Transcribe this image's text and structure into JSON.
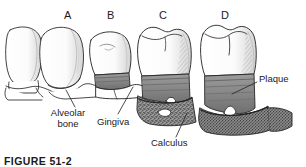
{
  "figure": {
    "domain": "anatomical-illustration",
    "caption_partial": "FIGURE 51-2",
    "background_color": "#ffffff",
    "ink_color": "#1a1a1a"
  },
  "panels": [
    {
      "id": "A",
      "letter": "A",
      "x": 64,
      "y": 10,
      "description": "healthy teeth, normal alveolar bone, no plaque"
    },
    {
      "id": "B",
      "letter": "B",
      "x": 107,
      "y": 10,
      "description": "gingivitis, inflamed gingiva band"
    },
    {
      "id": "C",
      "letter": "C",
      "x": 159,
      "y": 10,
      "description": "early periodontitis with calculus and bone loss"
    },
    {
      "id": "D",
      "letter": "D",
      "x": 221,
      "y": 10,
      "description": "advanced periodontitis, furcation exposed"
    }
  ],
  "callouts": [
    {
      "name": "alveolar-bone",
      "label_line1": "Alveolar",
      "label_line2": "bone",
      "label_x": 39,
      "label_y": 110,
      "label_width": 58,
      "leader": {
        "x1": 75,
        "y1": 108,
        "x2": 66,
        "y2": 90
      }
    },
    {
      "name": "gingiva",
      "label_line1": "Gingiva",
      "label_line2": "",
      "label_x": 97,
      "label_y": 117,
      "label_width": 46,
      "leader": {
        "x1": 118,
        "y1": 115,
        "x2": 133,
        "y2": 88
      }
    },
    {
      "name": "calculus",
      "label_line1": "Calculus",
      "label_line2": "",
      "label_x": 151,
      "label_y": 140,
      "label_width": 50,
      "leader": {
        "x1": 176,
        "y1": 138,
        "x2": 186,
        "y2": 114
      }
    },
    {
      "name": "plaque",
      "label_line1": "Plaque",
      "label_line2": "",
      "label_x": 259,
      "label_y": 76,
      "label_width": 42,
      "leader": {
        "x1": 258,
        "y1": 81,
        "x2": 232,
        "y2": 93
      }
    }
  ],
  "palette": {
    "enamel_fill": "#ffffff",
    "enamel_shade": "#d8d8d8",
    "enamel_shade_light": "#ececec",
    "outline": "#2b2b2b",
    "gingiva_fill": "#8f8f8f",
    "gingiva_dark": "#6e6e6e",
    "calculus_fill": "#8a8a8a",
    "calculus_speckle": "#3a3a3a",
    "bone_fill": "#ffffff",
    "leader_line": "#2b2b2b"
  }
}
